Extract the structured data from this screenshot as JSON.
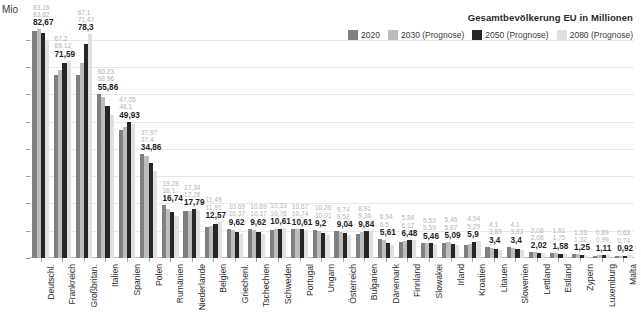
{
  "legend": {
    "title": "Gesamtbevölkerung EU in Millionen",
    "items": [
      {
        "label": "2020",
        "color": "#808080"
      },
      {
        "label": "2030 (Prognose)",
        "color": "#bdbdbd"
      },
      {
        "label": "2050 (Prognose)",
        "color": "#262626"
      },
      {
        "label": "2080 (Prognose)",
        "color": "#e0e0e0"
      }
    ]
  },
  "axes": {
    "ylabel": "Mio",
    "yticks": [
      0,
      10,
      20,
      30,
      40,
      50,
      60,
      70,
      80
    ],
    "ylim": [
      0,
      88
    ]
  },
  "chart_data": {
    "type": "bar",
    "title": "Gesamtbevölkerung EU in Millionen",
    "xlabel": "",
    "ylabel": "Mio",
    "ylim": [
      0,
      88
    ],
    "grid": true,
    "legend_position": "top-right",
    "categories": [
      "Deutschl.",
      "Frankreich",
      "Großbritan.",
      "Italien",
      "Spanien",
      "Polen",
      "Rumänien",
      "Niederlande",
      "Belgien",
      "Griechenl.",
      "Tschechien",
      "Schweden",
      "Portugal",
      "Ungarn",
      "Österreich",
      "Bulgarien",
      "Dänemark",
      "Finnland",
      "Slowakei",
      "Irland",
      "Kroatien",
      "Litauen",
      "Slowenien",
      "Lettland",
      "Estland",
      "Zypern",
      "Luxemburg",
      "Malta"
    ],
    "series": [
      {
        "name": "2020",
        "color": "#808080",
        "values": [
          83.16,
          67.2,
          67.1,
          60.23,
          47.05,
          37.97,
          19.28,
          17.34,
          11.49,
          10.69,
          10.69,
          10.33,
          10.67,
          10.26,
          9.74,
          8.91,
          6.94,
          5.84,
          5.53,
          5.46,
          4.94,
          4.1,
          4.1,
          2.08,
          1.91,
          1.33,
          0.89,
          0.63
        ]
      },
      {
        "name": "2030 (Prognose)",
        "color": "#bdbdbd",
        "values": [
          83.82,
          69.12,
          71.47,
          58.96,
          48.1,
          37.4,
          18.1,
          17.28,
          11.91,
          10.37,
          10.37,
          10.76,
          10.74,
          10.01,
          9.52,
          9.36,
          6.5,
          6.17,
          5.59,
          5.87,
          5.29,
          3.83,
          3.83,
          2.08,
          1.75,
          1.32,
          0.99,
          0.74
        ]
      },
      {
        "name": "2050 (Prognose)",
        "color": "#262626",
        "values": [
          82.67,
          71.59,
          78.3,
          55.86,
          49.93,
          34.86,
          16.74,
          17.79,
          12.57,
          9.62,
          9.62,
          10.61,
          10.61,
          9.2,
          9.04,
          9.84,
          5.61,
          6.48,
          5.46,
          5.09,
          5.9,
          3.4,
          3.4,
          2.02,
          1.58,
          1.25,
          1.11,
          0.92
        ]
      },
      {
        "name": "2080 (Prognose)",
        "color": "#e0e0e0",
        "values": [
          79.5,
          72.3,
          82.0,
          52.5,
          49.0,
          32.0,
          15.3,
          17.6,
          13.1,
          8.9,
          8.9,
          10.9,
          10.4,
          8.6,
          8.5,
          10.0,
          4.9,
          6.6,
          5.2,
          4.8,
          6.2,
          3.0,
          3.0,
          1.9,
          1.4,
          1.2,
          1.2,
          1.0
        ]
      }
    ],
    "data_labels": [
      {
        "category": "Deutschl.",
        "v2020": "83,16",
        "v2030": "83,82",
        "v2050": "82,67",
        "v2080": ""
      },
      {
        "category": "Frankreich",
        "v2020": "67,2",
        "v2030": "69,12",
        "v2050": "71,59",
        "v2080": ""
      },
      {
        "category": "Großbritan.",
        "v2020": "67,1",
        "v2030": "71,47",
        "v2050": "78,3",
        "v2080": ""
      },
      {
        "category": "Italien",
        "v2020": "60,23",
        "v2030": "58,96",
        "v2050": "55,86",
        "v2080": ""
      },
      {
        "category": "Spanien",
        "v2020": "47,05",
        "v2030": "48,1",
        "v2050": "49,93",
        "v2080": ""
      },
      {
        "category": "Polen",
        "v2020": "37,97",
        "v2030": "37,4",
        "v2050": "34,86",
        "v2080": ""
      },
      {
        "category": "Rumänien",
        "v2020": "19,28",
        "v2030": "18,1",
        "v2050": "16,74",
        "v2080": ""
      },
      {
        "category": "Niederlande",
        "v2020": "17,34",
        "v2030": "17,28",
        "v2050": "17,79",
        "v2080": ""
      },
      {
        "category": "Belgien",
        "v2020": "11,49",
        "v2030": "11,91",
        "v2050": "12,57",
        "v2080": ""
      },
      {
        "category": "Griechenl.",
        "v2020": "10,69",
        "v2030": "10,37",
        "v2050": "9,62",
        "v2080": ""
      },
      {
        "category": "Tschechien",
        "v2020": "10,69",
        "v2030": "10,37",
        "v2050": "9,62",
        "v2080": ""
      },
      {
        "category": "Schweden",
        "v2020": "10,33",
        "v2030": "10,76",
        "v2050": "10,61",
        "v2080": ""
      },
      {
        "category": "Portugal",
        "v2020": "10,67",
        "v2030": "10,74",
        "v2050": "10,61",
        "v2080": ""
      },
      {
        "category": "Ungarn",
        "v2020": "10,26",
        "v2030": "10,01",
        "v2050": "9,2",
        "v2080": ""
      },
      {
        "category": "Österreich",
        "v2020": "9,74",
        "v2030": "9,52",
        "v2050": "9,04",
        "v2080": ""
      },
      {
        "category": "Bulgarien",
        "v2020": "8,91",
        "v2030": "9,36",
        "v2050": "9,84",
        "v2080": ""
      },
      {
        "category": "Dänemark",
        "v2020": "6,94",
        "v2030": "6,5",
        "v2050": "5,61",
        "v2080": ""
      },
      {
        "category": "Finnland",
        "v2020": "5,84",
        "v2030": "6,17",
        "v2050": "6,48",
        "v2080": ""
      },
      {
        "category": "Slowakei",
        "v2020": "5,53",
        "v2030": "5,59",
        "v2050": "5,46",
        "v2080": ""
      },
      {
        "category": "Irland",
        "v2020": "5,46",
        "v2030": "5,87",
        "v2050": "5,09",
        "v2080": ""
      },
      {
        "category": "Kroatien",
        "v2020": "4,94",
        "v2030": "5,29",
        "v2050": "5,9",
        "v2080": ""
      },
      {
        "category": "Litauen",
        "v2020": "4,1",
        "v2030": "3,83",
        "v2050": "3,4",
        "v2080": ""
      },
      {
        "category": "Slowenien",
        "v2020": "4,1",
        "v2030": "3,83",
        "v2050": "3,4",
        "v2080": ""
      },
      {
        "category": "Lettland",
        "v2020": "2,08",
        "v2030": "2,08",
        "v2050": "2,02",
        "v2080": ""
      },
      {
        "category": "Estland",
        "v2020": "1,91",
        "v2030": "1,75",
        "v2050": "1,58",
        "v2080": ""
      },
      {
        "category": "Zypern",
        "v2020": "1,33",
        "v2030": "1,32",
        "v2050": "1,25",
        "v2080": ""
      },
      {
        "category": "Luxemburg",
        "v2020": "0,89",
        "v2030": "0,99",
        "v2050": "1,11",
        "v2080": ""
      },
      {
        "category": "Malta",
        "v2020": "0,63",
        "v2030": "0,74",
        "v2050": "0,92",
        "v2080": ""
      },
      {
        "category": "Malta2",
        "v2020": "0,5",
        "v2030": "0,6",
        "v2050": "0,7",
        "v2080": ""
      }
    ]
  }
}
